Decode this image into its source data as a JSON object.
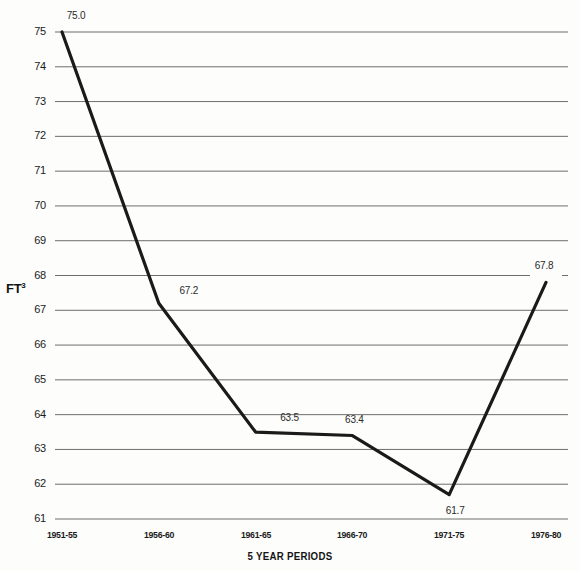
{
  "chart_data": {
    "type": "line",
    "title": "",
    "subtitle": "",
    "xlabel": "5 YEAR PERIODS",
    "ylabel": "FT³",
    "categories": [
      "1951-55",
      "1956-60",
      "1961-65",
      "1966-70",
      "1971-75",
      "1976-80"
    ],
    "values": [
      75.0,
      67.2,
      63.5,
      63.4,
      61.7,
      67.8
    ],
    "point_labels": [
      "75.0",
      "67.2",
      "63.5",
      "63.4",
      "61.7",
      "67.8"
    ],
    "ylim": [
      61,
      75
    ],
    "yticks": [
      75,
      74,
      73,
      72,
      71,
      70,
      69,
      68,
      67,
      66,
      65,
      64,
      63,
      62,
      61
    ],
    "ytick_labels": [
      "75",
      "74",
      "73",
      "72",
      "71",
      "70",
      "69",
      "68",
      "67",
      "66",
      "65",
      "64",
      "63",
      "62",
      "61"
    ],
    "grid": true,
    "grid_axis": "y",
    "legend": false,
    "legend_position": "none",
    "series": [
      {
        "name": "",
        "values": [
          75.0,
          67.2,
          63.5,
          63.4,
          61.7,
          67.8
        ]
      }
    ],
    "colors": {
      "line": "#1a1a1a",
      "grid": "#6d6d6d",
      "text": "#1b1b1b",
      "background": "#fdfdfb"
    }
  }
}
